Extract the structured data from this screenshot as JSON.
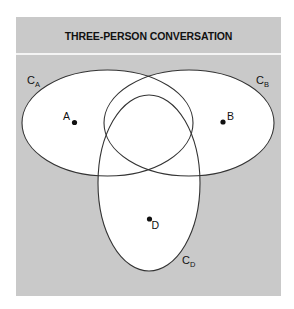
{
  "diagram": {
    "title": "THREE-PERSON CONVERSATION",
    "colors": {
      "background": "#c9c9c9",
      "ellipse_fill": "#ffffff",
      "stroke": "#333333",
      "divider": "#f4f4f4"
    },
    "circles": [
      {
        "id": "CA",
        "label_main": "C",
        "label_sub": "A"
      },
      {
        "id": "CB",
        "label_main": "C",
        "label_sub": "B"
      },
      {
        "id": "CD",
        "label_main": "C",
        "label_sub": "D"
      }
    ],
    "persons": [
      {
        "id": "A",
        "label": "A"
      },
      {
        "id": "B",
        "label": "B"
      },
      {
        "id": "D",
        "label": "D"
      }
    ]
  }
}
